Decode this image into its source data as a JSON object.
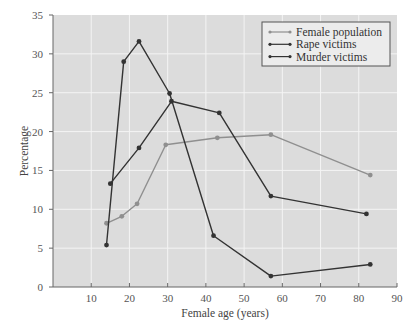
{
  "chart_data": {
    "type": "line",
    "title": "",
    "xlabel": "Female age (years)",
    "ylabel": "Percentage",
    "xlim": [
      0,
      90
    ],
    "ylim": [
      0,
      35
    ],
    "xticks": [
      10,
      20,
      30,
      40,
      50,
      60,
      70,
      80,
      90
    ],
    "yticks": [
      0,
      5,
      10,
      15,
      20,
      25,
      30,
      35
    ],
    "grid": true,
    "legend_position": "upper right",
    "series": [
      {
        "name": "Female population",
        "color": "#8f8f8f",
        "x": [
          14,
          18,
          22,
          29.5,
          43,
          57,
          83
        ],
        "y": [
          8.2,
          9.1,
          10.7,
          18.3,
          19.2,
          19.6,
          14.4
        ]
      },
      {
        "name": "Rape victims",
        "color": "#333333",
        "x": [
          15,
          22.5,
          31,
          43.5,
          57,
          82
        ],
        "y": [
          13.3,
          17.9,
          23.9,
          22.4,
          11.7,
          9.4
        ]
      },
      {
        "name": "Murder victims",
        "color": "#333333",
        "x": [
          14,
          18.5,
          22.5,
          30.5,
          42,
          57,
          83
        ],
        "y": [
          5.4,
          29.0,
          31.6,
          24.9,
          6.6,
          1.4,
          2.9
        ]
      }
    ]
  },
  "colors": {
    "plot_background": "#dcdcdc",
    "grid": "#f4f4f4",
    "axis": "#666666"
  }
}
